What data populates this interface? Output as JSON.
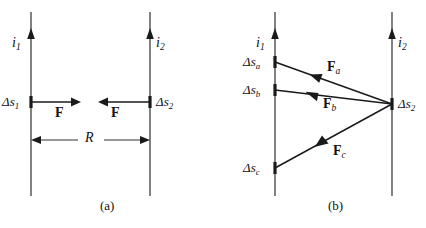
{
  "figure": {
    "type": "physics-force-diagram",
    "background_color": "#ffffff",
    "stroke_color": "#1a1a1a",
    "panels": [
      {
        "id": "a",
        "caption": "(a)",
        "caption_x": 100,
        "caption_y": 206,
        "wires": [
          {
            "name": "wire-1",
            "current_label_base": "i",
            "current_label_sub": "1",
            "x": 31,
            "y_top": 12,
            "y_bottom": 196,
            "arrow_tip_y": 30,
            "label_x": 12,
            "label_y": 36
          },
          {
            "name": "wire-2",
            "current_label_base": "i",
            "current_label_sub": "2",
            "x": 150,
            "y_top": 12,
            "y_bottom": 196,
            "arrow_tip_y": 30,
            "label_x": 156,
            "label_y": 36
          }
        ],
        "elements": [
          {
            "name": "segment-ds1",
            "label_base": "Δs",
            "label_sub": "1",
            "x": 31,
            "y": 102,
            "label_x": 2,
            "label_y": 95
          },
          {
            "name": "segment-ds2",
            "label_base": "Δs",
            "label_sub": "2",
            "x": 150,
            "y": 102,
            "label_x": 156,
            "label_y": 95
          }
        ],
        "forces": [
          {
            "name": "force-on-ds1",
            "label": "F",
            "label_sub": "",
            "from_x": 31,
            "from_y": 102,
            "to_x": 80,
            "to_y": 102,
            "label_x": 55,
            "label_y": 108
          },
          {
            "name": "force-on-ds2",
            "label": "F",
            "label_sub": "",
            "from_x": 150,
            "from_y": 102,
            "to_x": 99,
            "to_y": 102,
            "label_x": 111,
            "label_y": 108
          }
        ],
        "dimension": {
          "name": "separation-R",
          "label": "R",
          "x_start": 31,
          "x_end": 150,
          "y": 140,
          "label_x": 85,
          "label_y": 131
        }
      },
      {
        "id": "b",
        "caption": "(b)",
        "caption_x": 328,
        "caption_y": 206,
        "wires": [
          {
            "name": "wire-1",
            "current_label_base": "i",
            "current_label_sub": "1",
            "x": 275,
            "y_top": 12,
            "y_bottom": 196,
            "arrow_tip_y": 30,
            "label_x": 256,
            "label_y": 36
          },
          {
            "name": "wire-2",
            "current_label_base": "i",
            "current_label_sub": "2",
            "x": 392,
            "y_top": 12,
            "y_bottom": 196,
            "arrow_tip_y": 30,
            "label_x": 398,
            "label_y": 36
          }
        ],
        "elements": [
          {
            "name": "segment-ds-a",
            "label_base": "Δs",
            "label_sub": "a",
            "x": 275,
            "y": 62,
            "label_x": 243,
            "label_y": 55
          },
          {
            "name": "segment-ds-b",
            "label_base": "Δs",
            "label_sub": "b",
            "x": 275,
            "y": 90,
            "label_x": 243,
            "label_y": 83
          },
          {
            "name": "segment-ds-c",
            "label_base": "Δs",
            "label_sub": "c",
            "x": 275,
            "y": 168,
            "label_x": 243,
            "label_y": 161
          },
          {
            "name": "segment-ds2",
            "label_base": "Δs",
            "label_sub": "2",
            "x": 392,
            "y": 104,
            "label_x": 398,
            "label_y": 97
          }
        ],
        "forces": [
          {
            "name": "force-a",
            "label": "F",
            "label_sub": "a",
            "from_x": 392,
            "from_y": 104,
            "to_x": 275,
            "to_y": 62,
            "arrowhead_x": 317,
            "arrowhead_y": 77,
            "label_x": 327,
            "label_y": 62
          },
          {
            "name": "force-b",
            "label": "F",
            "label_sub": "b",
            "from_x": 392,
            "from_y": 104,
            "to_x": 275,
            "to_y": 90,
            "arrowhead_x": 313,
            "arrowhead_y": 94,
            "label_x": 323,
            "label_y": 99
          },
          {
            "name": "force-c",
            "label": "F",
            "label_sub": "c",
            "from_x": 392,
            "from_y": 104,
            "to_x": 275,
            "to_y": 168,
            "arrowhead_x": 322,
            "arrowhead_y": 143,
            "label_x": 333,
            "label_y": 146
          }
        ]
      }
    ]
  }
}
